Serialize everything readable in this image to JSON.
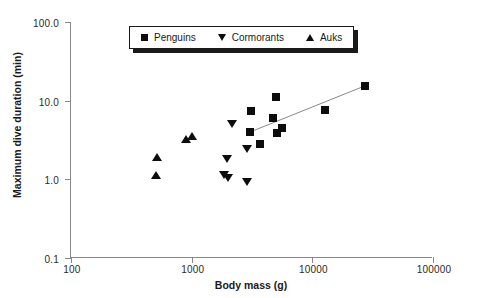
{
  "chart_data": {
    "type": "scatter",
    "title": "",
    "xlabel": "Body mass (g)",
    "ylabel": "Maximum dive duration (min)",
    "xscale": "log",
    "yscale": "log",
    "xlim": [
      100,
      100000
    ],
    "ylim": [
      0.1,
      100.0
    ],
    "xticks": [
      "100",
      "1000",
      "10000",
      "100000"
    ],
    "xtick_values": [
      100,
      1000,
      10000,
      100000
    ],
    "yticks": [
      "0.1",
      "1.0",
      "10.0",
      "100.0"
    ],
    "ytick_values": [
      0.1,
      1.0,
      10.0,
      100.0
    ],
    "grid": false,
    "legend_position": "top-center",
    "marker_color": "#0d0d0d",
    "trendline_color": "#8a8a8a",
    "series": [
      {
        "name": "Penguins",
        "marker": "square",
        "points": [
          {
            "x": 3050,
            "y": 3.95
          },
          {
            "x": 3100,
            "y": 7.3
          },
          {
            "x": 3700,
            "y": 2.85
          },
          {
            "x": 4700,
            "y": 6.1
          },
          {
            "x": 5000,
            "y": 11.0
          },
          {
            "x": 5100,
            "y": 3.85
          },
          {
            "x": 5600,
            "y": 4.5
          },
          {
            "x": 12800,
            "y": 7.7
          },
          {
            "x": 27500,
            "y": 15.5
          }
        ]
      },
      {
        "name": "Cormorants",
        "marker": "triangle-down",
        "points": [
          {
            "x": 1850,
            "y": 1.12
          },
          {
            "x": 1950,
            "y": 1.8
          },
          {
            "x": 2000,
            "y": 1.05
          },
          {
            "x": 2150,
            "y": 5.1
          },
          {
            "x": 2850,
            "y": 2.45
          },
          {
            "x": 2900,
            "y": 0.93
          }
        ]
      },
      {
        "name": "Auks",
        "marker": "triangle-up",
        "points": [
          {
            "x": 510,
            "y": 1.13
          },
          {
            "x": 520,
            "y": 1.9
          },
          {
            "x": 900,
            "y": 3.3
          },
          {
            "x": 1000,
            "y": 3.6
          }
        ]
      }
    ],
    "trendline": {
      "name": "penguin-regression",
      "x_start": 3050,
      "y_start": 4.0,
      "x_end": 27500,
      "y_end": 15.5
    },
    "legend": [
      {
        "label": "Penguins",
        "marker": "square"
      },
      {
        "label": "Cormorants",
        "marker": "triangle-down"
      },
      {
        "label": "Auks",
        "marker": "triangle-up"
      }
    ]
  }
}
